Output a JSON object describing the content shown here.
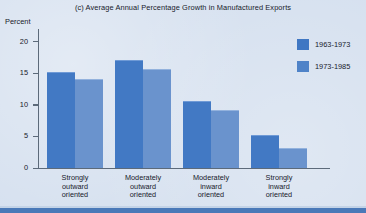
{
  "chart_data": {
    "type": "bar",
    "title": "(c) Average Annual Percentage Growth in Manufactured Exports",
    "xlabel": "",
    "ylabel": "Percent",
    "ylim": [
      0,
      22
    ],
    "yticks": [
      0,
      5,
      10,
      15,
      20
    ],
    "ytick_labels": [
      "0",
      "5",
      "10",
      "15",
      "20"
    ],
    "grid": false,
    "legend_position": "right",
    "categories": [
      "Strongly\noutward\noriented",
      "Moderately\noutward\noriented",
      "Moderately\ninward\noriented",
      "Strongly\ninward\noriented"
    ],
    "category_lines": [
      [
        "Strongly",
        "outward",
        "oriented"
      ],
      [
        "Moderately",
        "outward",
        "oriented"
      ],
      [
        "Moderately",
        "inward",
        "oriented"
      ],
      [
        "Strongly",
        "inward",
        "oriented"
      ]
    ],
    "series": [
      {
        "name": "1963-1973",
        "color": "#4279c4",
        "values": [
          15.0,
          17.0,
          10.5,
          5.0
        ]
      },
      {
        "name": "1973-1985",
        "color": "#6a93cd",
        "values": [
          14.0,
          15.5,
          9.0,
          3.0
        ]
      }
    ]
  },
  "legend": {
    "entries": [
      {
        "label": "1963-1973",
        "color": "#3f77c3"
      },
      {
        "label": "1973-1985",
        "color": "#4f83c8"
      }
    ]
  }
}
